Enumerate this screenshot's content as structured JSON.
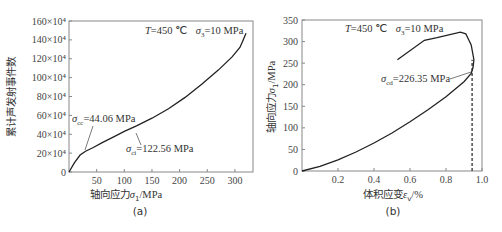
{
  "figure": {
    "panel_a": {
      "caption": "(a)",
      "condition_T": "T=450 ℃",
      "condition_s3": "σ3=10 MPa",
      "xlabel": "轴向应力σ1/MPa",
      "ylabel": "累计声发射事件数",
      "annotation_cc": "σcc=44.06 MPa",
      "annotation_ci": "σci=122.56 MPa"
    },
    "panel_b": {
      "caption": "(b)",
      "condition_T": "T=450 ℃",
      "condition_s3": "σ3=10 MPa",
      "xlabel": "体积应变εv/%",
      "ylabel": "轴向应力σ1/MPa",
      "annotation_cd": "σcd=226.35 MPa"
    }
  },
  "chart_data": [
    {
      "type": "line",
      "title": "(a)",
      "annotations": [
        "T=450 ℃",
        "σ3=10 MPa",
        "σcc=44.06 MPa",
        "σci=122.56 MPa"
      ],
      "xlabel": "轴向应力σ1/MPa",
      "ylabel": "累计声发射事件数",
      "xlim": [
        0,
        330
      ],
      "ylim": [
        0,
        160
      ],
      "y_unit": "×10^4",
      "xticks": [
        50,
        100,
        150,
        200,
        250,
        300
      ],
      "yticks": [
        "0",
        "20×10⁴",
        "40×10⁴",
        "60×10⁴",
        "80×10⁴",
        "100×10⁴",
        "120×10⁴",
        "140×10⁴",
        "160×10⁴"
      ],
      "grid": false,
      "series": [
        {
          "name": "cumulative AE events",
          "x": [
            0,
            10,
            20,
            30,
            44,
            60,
            80,
            100,
            122,
            150,
            180,
            210,
            240,
            270,
            295,
            309,
            315,
            320
          ],
          "y": [
            0,
            10,
            18,
            22,
            26,
            31,
            37,
            43,
            49,
            57,
            67,
            79,
            93,
            108,
            122,
            132,
            140,
            147
          ]
        }
      ]
    },
    {
      "type": "line",
      "title": "(b)",
      "annotations": [
        "T=450 ℃",
        "σ3=10 MPa",
        "σcd=226.35 MPa"
      ],
      "xlabel": "体积应变εv/%",
      "ylabel": "轴向应力σ1/MPa",
      "xlim": [
        0,
        1.0
      ],
      "ylim": [
        0,
        350
      ],
      "xticks": [
        0.2,
        0.4,
        0.6,
        0.8,
        1.0
      ],
      "yticks": [
        0,
        50,
        100,
        150,
        200,
        250,
        300,
        350
      ],
      "grid": false,
      "vertical_dashed_line_x": 0.945,
      "series": [
        {
          "name": "axial stress vs volumetric strain",
          "x": [
            0,
            0.1,
            0.2,
            0.3,
            0.4,
            0.5,
            0.6,
            0.7,
            0.8,
            0.9,
            0.94,
            0.95,
            0.955,
            0.94,
            0.91,
            0.88,
            0.75,
            0.68,
            0.53
          ],
          "y": [
            0,
            11,
            26,
            44,
            65,
            88,
            114,
            142,
            172,
            207,
            226,
            240,
            258,
            292,
            318,
            322,
            309,
            303,
            258
          ]
        }
      ]
    }
  ]
}
